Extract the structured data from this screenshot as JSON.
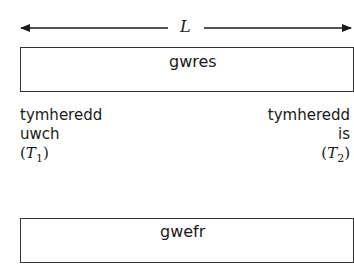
{
  "diagram": {
    "length_label": "L",
    "top_bar": {
      "flow_label": "gwres"
    },
    "bottom_bar": {
      "flow_label": "gwefr"
    },
    "left_end": {
      "line1": "tymheredd",
      "line2": "uwch",
      "symbol_open": "(",
      "symbol": "T",
      "subscript": "1",
      "symbol_close": ")"
    },
    "right_end": {
      "line1": "tymheredd",
      "line2": "is",
      "symbol_open": "(",
      "symbol": "T",
      "subscript": "2",
      "symbol_close": ")"
    }
  }
}
